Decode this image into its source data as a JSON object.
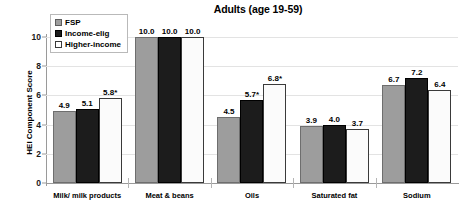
{
  "chart_data": {
    "type": "bar",
    "title": "Adults (age 19-59)",
    "xlabel": "",
    "ylabel": "HEI Component Score",
    "ylim": [
      0,
      10
    ],
    "yticks": [
      0,
      2,
      4,
      6,
      8,
      10
    ],
    "grid": false,
    "legend_position": "top-left",
    "categories": [
      "Milk/ milk products",
      "Meat & beans",
      "Oils",
      "Saturated fat",
      "Sodium"
    ],
    "series": [
      {
        "name": "FSP",
        "color": "#9d9d9d",
        "values": [
          4.9,
          10.0,
          4.5,
          3.9,
          6.7
        ],
        "labels": [
          "4.9",
          "10.0",
          "4.5",
          "3.9",
          "6.7"
        ]
      },
      {
        "name": "Income-elig",
        "color": "#1c1c1c",
        "values": [
          5.1,
          10.0,
          5.7,
          4.0,
          7.2
        ],
        "labels": [
          "5.1",
          "10.0",
          "5.7*",
          "4.0",
          "7.2"
        ]
      },
      {
        "name": "Higher-income",
        "color": "#ffffff",
        "values": [
          5.8,
          10.0,
          6.8,
          3.7,
          6.4
        ],
        "labels": [
          "5.8*",
          "10.0",
          "6.8*",
          "3.7",
          "6.4"
        ]
      }
    ],
    "annotation_note": "* denotes statistically significant difference"
  }
}
